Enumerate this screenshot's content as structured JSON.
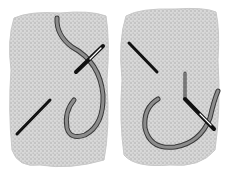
{
  "illustration": {
    "subject": "embroidery stitch steps",
    "panels": [
      {
        "id": "step-1",
        "elements": [
          "woven-fabric",
          "thread",
          "needle",
          "stitch"
        ]
      },
      {
        "id": "step-2",
        "elements": [
          "woven-fabric",
          "thread",
          "needle",
          "stitch"
        ]
      }
    ],
    "colors": {
      "fabric": "#d2d2d2",
      "fabric_weave": "#b8b8b8",
      "thread": "#8c8c8c",
      "thread_outline": "#3a3a3a",
      "stitch": "#111111",
      "background": "#ffffff"
    }
  }
}
